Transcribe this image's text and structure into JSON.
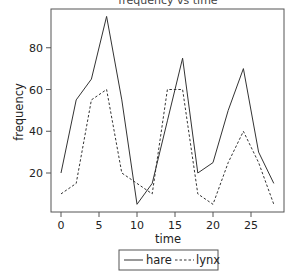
{
  "chart_data": {
    "type": "line",
    "title": "frequency vs time",
    "xlabel": "time",
    "ylabel": "frequency",
    "x": [
      0,
      2,
      4,
      6,
      8,
      10,
      12,
      14,
      16,
      18,
      20,
      22,
      24,
      26,
      28
    ],
    "series": [
      {
        "name": "hare",
        "style": "solid",
        "values": [
          20,
          55,
          65,
          95,
          55,
          5,
          15,
          45,
          75,
          20,
          25,
          50,
          70,
          30,
          15
        ]
      },
      {
        "name": "lynx",
        "style": "dashed",
        "values": [
          10,
          15,
          55,
          60,
          20,
          15,
          10,
          60,
          60,
          10,
          5,
          25,
          40,
          25,
          5
        ]
      }
    ],
    "xticks": [
      0,
      5,
      10,
      15,
      20,
      25
    ],
    "yticks": [
      20,
      40,
      60,
      80
    ],
    "xlim": [
      -1.3,
      29.8
    ],
    "ylim": [
      1,
      98
    ],
    "grid": false,
    "legend_position": "bottom-center",
    "colors": {
      "line": "#333333",
      "frame": "#555555",
      "background": "#ffffff"
    }
  }
}
